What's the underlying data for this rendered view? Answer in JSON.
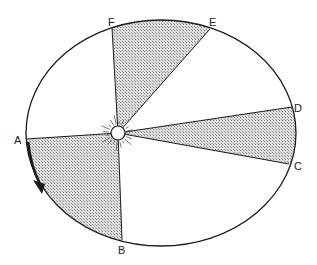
{
  "colors": {
    "line": "#1a1a1a",
    "shade_fg": "#9a9a9a",
    "shade_bg": "#dcdcdc",
    "sun_fill": "#ffffff"
  },
  "points": {
    "A": "A",
    "B": "B",
    "C": "C",
    "D": "D",
    "E": "E",
    "F": "F"
  },
  "sectors": [
    {
      "from": "A",
      "to": "B",
      "shaded": true
    },
    {
      "from": "C",
      "to": "D",
      "shaded": true
    },
    {
      "from": "E",
      "to": "F",
      "shaded": true
    }
  ],
  "central_body": "sun-icon",
  "motion_direction": "counterclockwise from A toward B"
}
